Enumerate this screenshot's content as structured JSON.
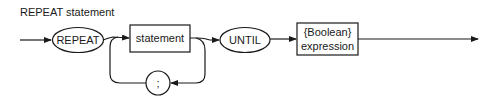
{
  "title": "REPEAT statement",
  "diagram": {
    "type": "syntax-diagram",
    "nodes": [
      {
        "id": "repeat",
        "shape": "oval",
        "label": "REPEAT",
        "kind": "terminal"
      },
      {
        "id": "statement",
        "shape": "box",
        "label": "statement",
        "kind": "nonterminal"
      },
      {
        "id": "semicolon",
        "shape": "circle",
        "label": ";",
        "kind": "terminal"
      },
      {
        "id": "until",
        "shape": "oval",
        "label": "UNTIL",
        "kind": "terminal"
      },
      {
        "id": "bool",
        "shape": "box",
        "label_line1": "{Boolean}",
        "label_line2": "expression",
        "kind": "nonterminal"
      }
    ],
    "edges": [
      {
        "from": "entry",
        "to": "repeat"
      },
      {
        "from": "repeat",
        "to": "statement"
      },
      {
        "from": "statement",
        "to": "until"
      },
      {
        "from": "statement",
        "to": "semicolon",
        "note": "loop back"
      },
      {
        "from": "semicolon",
        "to": "statement",
        "note": "loop back"
      },
      {
        "from": "until",
        "to": "bool"
      },
      {
        "from": "bool",
        "to": "exit"
      }
    ]
  },
  "colors": {
    "stroke": "#1a1a1a",
    "background": "#ffffff"
  }
}
